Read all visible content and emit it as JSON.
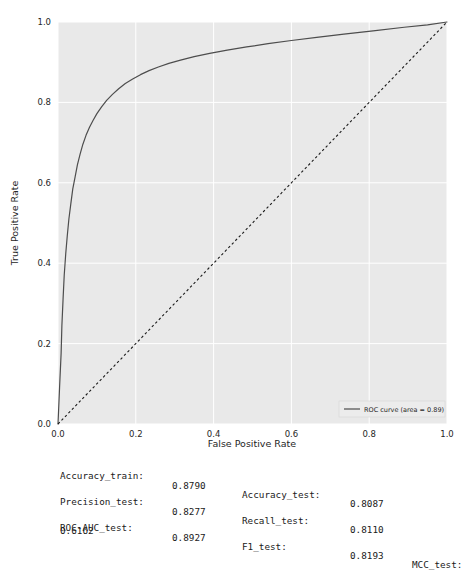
{
  "chart_data": {
    "type": "line",
    "title": "",
    "xlabel": "False Positive Rate",
    "ylabel": "True Positive Rate",
    "xlim": [
      0.0,
      1.0
    ],
    "ylim": [
      0.0,
      1.0
    ],
    "xticks": [
      "0.0",
      "0.2",
      "0.4",
      "0.6",
      "0.8",
      "1.0"
    ],
    "yticks": [
      "0.0",
      "0.2",
      "0.4",
      "0.6",
      "0.8",
      "1.0"
    ],
    "grid": true,
    "legend_position": "lower right",
    "series": [
      {
        "name": "ROC curve (area = 0.89)",
        "color": "#4d4d4d",
        "style": "solid",
        "x": [
          0.0,
          0.004,
          0.008,
          0.01,
          0.013,
          0.016,
          0.02,
          0.024,
          0.028,
          0.033,
          0.038,
          0.044,
          0.05,
          0.057,
          0.064,
          0.072,
          0.081,
          0.09,
          0.1,
          0.112,
          0.125,
          0.14,
          0.156,
          0.173,
          0.192,
          0.212,
          0.234,
          0.258,
          0.285,
          0.315,
          0.35,
          0.39,
          0.435,
          0.485,
          0.54,
          0.6,
          0.665,
          0.735,
          0.81,
          0.89,
          0.95,
          1.0
        ],
        "y": [
          0.0,
          0.09,
          0.175,
          0.245,
          0.31,
          0.37,
          0.425,
          0.47,
          0.51,
          0.548,
          0.585,
          0.615,
          0.645,
          0.672,
          0.696,
          0.718,
          0.738,
          0.755,
          0.772,
          0.789,
          0.805,
          0.82,
          0.834,
          0.847,
          0.858,
          0.869,
          0.879,
          0.888,
          0.897,
          0.905,
          0.914,
          0.922,
          0.93,
          0.938,
          0.946,
          0.954,
          0.962,
          0.97,
          0.978,
          0.987,
          0.993,
          1.0
        ]
      },
      {
        "name": "chance-diagonal",
        "color": "#1a1a1a",
        "style": "dashed",
        "x": [
          0.0,
          1.0
        ],
        "y": [
          0.0,
          1.0
        ]
      }
    ],
    "legend_entries": [
      {
        "label": "ROC curve (area = 0.89)",
        "color": "#4d4d4d"
      }
    ],
    "plot_bgcolor": "#e9e9e9",
    "grid_color": "#ffffff",
    "figure_bgcolor": "#ffffff"
  },
  "metrics": {
    "rows": [
      {
        "key1": "Accuracy_train:",
        "val1": "0.8790",
        "key2": "Accuracy_test:",
        "val2": "0.8087",
        "key3": "",
        "val3": ""
      },
      {
        "key1": "Precision_test:",
        "val1": "0.8277",
        "key2": "Recall_test:",
        "val2": "0.8110",
        "key3": "",
        "val3": ""
      },
      {
        "key1": "ROC-AUC_test:",
        "val1": "0.8927",
        "key2": "F1_test:",
        "val2": "0.8193",
        "key3": "MCC_test:",
        "val3": ""
      }
    ],
    "wrapped_value": "0.6162"
  }
}
